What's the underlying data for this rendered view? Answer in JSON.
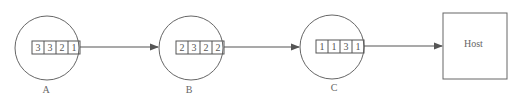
{
  "diagram": {
    "nodes": [
      {
        "id": "A",
        "label": "A",
        "queue": [
          "3",
          "3",
          "2",
          "1"
        ]
      },
      {
        "id": "B",
        "label": "B",
        "queue": [
          "2",
          "3",
          "2",
          "2"
        ]
      },
      {
        "id": "C",
        "label": "C",
        "queue": [
          "1",
          "1",
          "3",
          "1"
        ]
      }
    ],
    "host": {
      "label": "Host"
    },
    "edges": [
      {
        "from": "A",
        "to": "B"
      },
      {
        "from": "B",
        "to": "C"
      },
      {
        "from": "C",
        "to": "Host"
      }
    ]
  }
}
